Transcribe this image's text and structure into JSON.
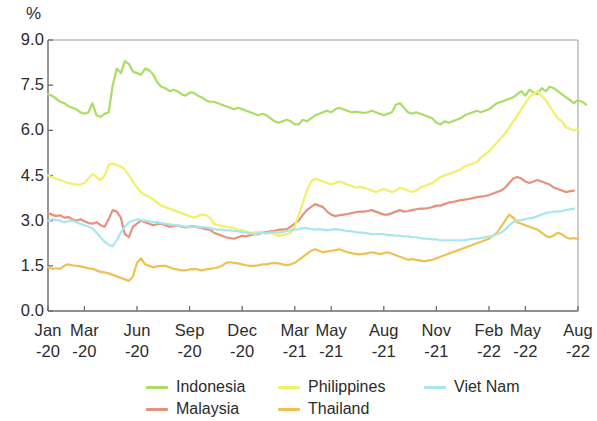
{
  "axis": {
    "unit_label": "%",
    "y_ticks": [
      "0.0",
      "1.5",
      "3.0",
      "4.5",
      "6.0",
      "7.5",
      "9.0"
    ],
    "y_min": 0.0,
    "y_max": 9.0,
    "x_ticks": [
      {
        "month": "Jan",
        "year": "-20"
      },
      {
        "month": "Mar",
        "year": "-20"
      },
      {
        "month": "Jun",
        "year": "-20"
      },
      {
        "month": "Sep",
        "year": "-20"
      },
      {
        "month": "Dec",
        "year": "-20"
      },
      {
        "month": "Mar",
        "year": "-21"
      },
      {
        "month": "May",
        "year": "-21"
      },
      {
        "month": "Aug",
        "year": "-21"
      },
      {
        "month": "Nov",
        "year": "-21"
      },
      {
        "month": "Feb",
        "year": "-22"
      },
      {
        "month": "May",
        "year": "-22"
      },
      {
        "month": "Aug",
        "year": "-22"
      }
    ]
  },
  "legend": [
    {
      "label": "Indonesia",
      "color": "#aadd66",
      "col": 0,
      "row": 0
    },
    {
      "label": "Malaysia",
      "color": "#e8917a",
      "col": 0,
      "row": 1
    },
    {
      "label": "Philippines",
      "color": "#f2ef69",
      "col": 1,
      "row": 0
    },
    {
      "label": "Thailand",
      "color": "#f0c152",
      "col": 1,
      "row": 1
    },
    {
      "label": "Viet Nam",
      "color": "#a8e6ee",
      "col": 2,
      "row": 0
    }
  ],
  "chart_data": {
    "type": "line",
    "title": "",
    "subtitle": "",
    "xlabel": "",
    "ylabel": "%",
    "ylim": [
      0.0,
      9.0
    ],
    "ytick_values": [
      0.0,
      1.5,
      3.0,
      4.5,
      6.0,
      7.5,
      9.0
    ],
    "grid": false,
    "legend_position": "bottom",
    "x_tick_labels": [
      "Jan -20",
      "Mar -20",
      "Jun -20",
      "Sep -20",
      "Dec -20",
      "Mar -21",
      "May -21",
      "Aug -21",
      "Nov -21",
      "Feb -22",
      "May -22",
      "Aug -22"
    ],
    "x_tick_indices": [
      0,
      9,
      22,
      35,
      48,
      61,
      70,
      83,
      96,
      109,
      118,
      131
    ],
    "x_count": 132,
    "series": [
      {
        "name": "Indonesia",
        "color": "#aadd66",
        "values": [
          7.2,
          7.15,
          7.05,
          6.95,
          6.9,
          6.8,
          6.75,
          6.7,
          6.6,
          6.55,
          6.6,
          6.9,
          6.5,
          6.45,
          6.55,
          6.6,
          7.5,
          8.05,
          7.9,
          8.3,
          8.2,
          7.95,
          7.9,
          7.85,
          8.05,
          8.0,
          7.85,
          7.6,
          7.45,
          7.4,
          7.3,
          7.35,
          7.3,
          7.2,
          7.15,
          7.25,
          7.25,
          7.15,
          7.1,
          7.0,
          6.95,
          6.95,
          6.9,
          6.85,
          6.8,
          6.75,
          6.7,
          6.75,
          6.7,
          6.65,
          6.6,
          6.55,
          6.5,
          6.55,
          6.5,
          6.4,
          6.3,
          6.25,
          6.3,
          6.35,
          6.3,
          6.2,
          6.2,
          6.35,
          6.3,
          6.4,
          6.5,
          6.55,
          6.6,
          6.65,
          6.6,
          6.7,
          6.75,
          6.7,
          6.65,
          6.6,
          6.62,
          6.6,
          6.58,
          6.6,
          6.65,
          6.6,
          6.55,
          6.5,
          6.55,
          6.6,
          6.85,
          6.9,
          6.75,
          6.6,
          6.55,
          6.6,
          6.55,
          6.5,
          6.45,
          6.4,
          6.25,
          6.2,
          6.3,
          6.25,
          6.3,
          6.35,
          6.4,
          6.5,
          6.55,
          6.6,
          6.65,
          6.6,
          6.65,
          6.7,
          6.8,
          6.9,
          6.95,
          7.0,
          7.05,
          7.1,
          7.2,
          7.3,
          7.15,
          7.35,
          7.25,
          7.2,
          7.4,
          7.3,
          7.45,
          7.4,
          7.3,
          7.2,
          7.1,
          7.0,
          6.9,
          7.0,
          6.95,
          6.85
        ]
      },
      {
        "name": "Malaysia",
        "color": "#e8917a",
        "values": [
          3.25,
          3.2,
          3.15,
          3.18,
          3.1,
          3.12,
          3.05,
          3.0,
          3.05,
          2.98,
          2.92,
          2.9,
          2.95,
          2.85,
          2.8,
          3.05,
          3.35,
          3.3,
          3.1,
          2.55,
          2.45,
          2.8,
          2.9,
          3.0,
          2.95,
          2.9,
          2.85,
          2.88,
          2.9,
          2.85,
          2.8,
          2.82,
          2.85,
          2.8,
          2.78,
          2.8,
          2.82,
          2.78,
          2.75,
          2.72,
          2.7,
          2.6,
          2.55,
          2.5,
          2.45,
          2.42,
          2.4,
          2.45,
          2.5,
          2.48,
          2.52,
          2.55,
          2.55,
          2.6,
          2.62,
          2.65,
          2.66,
          2.7,
          2.7,
          2.72,
          2.8,
          2.9,
          3.0,
          3.2,
          3.35,
          3.45,
          3.55,
          3.5,
          3.45,
          3.3,
          3.2,
          3.15,
          3.18,
          3.2,
          3.22,
          3.25,
          3.28,
          3.3,
          3.3,
          3.32,
          3.35,
          3.3,
          3.25,
          3.2,
          3.2,
          3.25,
          3.3,
          3.35,
          3.3,
          3.32,
          3.35,
          3.38,
          3.4,
          3.4,
          3.42,
          3.45,
          3.5,
          3.5,
          3.55,
          3.6,
          3.62,
          3.65,
          3.68,
          3.7,
          3.72,
          3.75,
          3.78,
          3.8,
          3.82,
          3.85,
          3.9,
          3.95,
          4.0,
          4.1,
          4.25,
          4.4,
          4.45,
          4.4,
          4.3,
          4.25,
          4.3,
          4.35,
          4.3,
          4.25,
          4.2,
          4.1,
          4.05,
          4.0,
          3.95,
          3.98,
          4.0
        ]
      },
      {
        "name": "Philippines",
        "color": "#f2ef69",
        "values": [
          4.5,
          4.45,
          4.38,
          4.35,
          4.3,
          4.25,
          4.22,
          4.2,
          4.2,
          4.25,
          4.4,
          4.55,
          4.45,
          4.35,
          4.5,
          4.85,
          4.9,
          4.85,
          4.8,
          4.7,
          4.5,
          4.3,
          4.1,
          3.95,
          3.85,
          3.8,
          3.7,
          3.6,
          3.5,
          3.45,
          3.4,
          3.35,
          3.3,
          3.25,
          3.2,
          3.15,
          3.1,
          3.15,
          3.2,
          3.18,
          3.1,
          2.9,
          2.85,
          2.82,
          2.8,
          2.78,
          2.75,
          2.7,
          2.68,
          2.65,
          2.6,
          2.6,
          2.62,
          2.6,
          2.58,
          2.6,
          2.55,
          2.5,
          2.52,
          2.55,
          2.6,
          2.8,
          3.2,
          3.6,
          4.0,
          4.3,
          4.4,
          4.35,
          4.3,
          4.25,
          4.2,
          4.25,
          4.3,
          4.25,
          4.2,
          4.15,
          4.1,
          4.12,
          4.1,
          4.05,
          4.0,
          3.95,
          4.0,
          4.05,
          4.0,
          3.95,
          4.0,
          4.1,
          4.05,
          4.0,
          3.95,
          4.0,
          4.1,
          4.15,
          4.2,
          4.25,
          4.35,
          4.45,
          4.5,
          4.55,
          4.6,
          4.65,
          4.7,
          4.8,
          4.85,
          4.9,
          4.95,
          5.1,
          5.2,
          5.3,
          5.45,
          5.6,
          5.75,
          5.9,
          6.1,
          6.3,
          6.5,
          6.7,
          6.9,
          7.1,
          7.2,
          7.3,
          7.15,
          7.0,
          6.8,
          6.6,
          6.4,
          6.3,
          6.1,
          6.05,
          6.0,
          6.05
        ]
      },
      {
        "name": "Thailand",
        "color": "#f0c152",
        "values": [
          1.45,
          1.4,
          1.42,
          1.4,
          1.5,
          1.55,
          1.52,
          1.5,
          1.48,
          1.45,
          1.42,
          1.4,
          1.35,
          1.3,
          1.28,
          1.25,
          1.2,
          1.15,
          1.1,
          1.05,
          1.0,
          1.15,
          1.6,
          1.75,
          1.55,
          1.5,
          1.45,
          1.48,
          1.5,
          1.5,
          1.45,
          1.4,
          1.38,
          1.35,
          1.35,
          1.38,
          1.4,
          1.38,
          1.35,
          1.38,
          1.4,
          1.42,
          1.45,
          1.5,
          1.6,
          1.62,
          1.6,
          1.58,
          1.55,
          1.52,
          1.5,
          1.5,
          1.52,
          1.55,
          1.55,
          1.58,
          1.6,
          1.58,
          1.55,
          1.52,
          1.55,
          1.6,
          1.7,
          1.8,
          1.9,
          2.0,
          2.05,
          2.0,
          1.95,
          1.98,
          2.0,
          2.02,
          2.05,
          2.0,
          1.95,
          1.92,
          1.9,
          1.88,
          1.9,
          1.92,
          1.95,
          1.92,
          1.9,
          1.92,
          1.95,
          1.9,
          1.85,
          1.8,
          1.75,
          1.7,
          1.72,
          1.7,
          1.68,
          1.65,
          1.68,
          1.7,
          1.75,
          1.8,
          1.85,
          1.9,
          1.95,
          2.0,
          2.05,
          2.1,
          2.15,
          2.2,
          2.25,
          2.3,
          2.35,
          2.4,
          2.5,
          2.6,
          2.8,
          3.0,
          3.2,
          3.1,
          2.95,
          2.9,
          2.85,
          2.8,
          2.75,
          2.7,
          2.6,
          2.5,
          2.45,
          2.5,
          2.6,
          2.55,
          2.45,
          2.4,
          2.42,
          2.4
        ]
      },
      {
        "name": "Viet Nam",
        "color": "#a8e6ee",
        "values": [
          3.0,
          3.05,
          3.02,
          3.0,
          2.95,
          2.98,
          3.0,
          2.95,
          2.9,
          2.85,
          2.8,
          2.75,
          2.6,
          2.45,
          2.3,
          2.2,
          2.15,
          2.35,
          2.6,
          2.8,
          2.95,
          3.0,
          3.05,
          3.02,
          3.0,
          2.98,
          2.95,
          2.95,
          2.92,
          2.9,
          2.88,
          2.85,
          2.85,
          2.82,
          2.8,
          2.78,
          2.8,
          2.8,
          2.78,
          2.78,
          2.75,
          2.72,
          2.7,
          2.7,
          2.68,
          2.68,
          2.65,
          2.65,
          2.62,
          2.6,
          2.58,
          2.55,
          2.58,
          2.6,
          2.58,
          2.6,
          2.62,
          2.6,
          2.62,
          2.65,
          2.68,
          2.7,
          2.72,
          2.75,
          2.75,
          2.72,
          2.7,
          2.72,
          2.7,
          2.68,
          2.7,
          2.72,
          2.7,
          2.68,
          2.65,
          2.65,
          2.62,
          2.6,
          2.6,
          2.58,
          2.55,
          2.55,
          2.55,
          2.55,
          2.52,
          2.52,
          2.5,
          2.5,
          2.48,
          2.48,
          2.45,
          2.45,
          2.42,
          2.4,
          2.4,
          2.38,
          2.38,
          2.35,
          2.35,
          2.35,
          2.35,
          2.35,
          2.35,
          2.35,
          2.38,
          2.4,
          2.4,
          2.42,
          2.45,
          2.48,
          2.5,
          2.55,
          2.6,
          2.7,
          2.85,
          2.95,
          3.0,
          3.02,
          3.05,
          3.08,
          3.1,
          3.15,
          3.2,
          3.25,
          3.28,
          3.3,
          3.3,
          3.32,
          3.35,
          3.38,
          3.4
        ]
      }
    ]
  }
}
